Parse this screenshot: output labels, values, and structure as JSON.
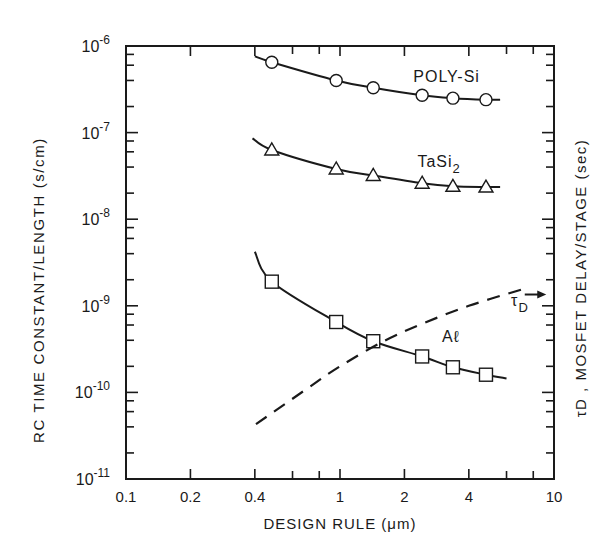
{
  "figure": {
    "xlabel": "DESIGN RULE (μm)",
    "ylabel_left": "RC TIME CONSTANT/LENGTH (s/cm)",
    "ylabel_right": "τD , MOSFET DELAY/STAGE (sec)"
  },
  "chart_data": {
    "type": "line",
    "title": "",
    "xlabel": "DESIGN RULE (μm)",
    "ylabel": "RC TIME CONSTANT/LENGTH (s/cm)",
    "ylabel_right": "τD , MOSFET DELAY/STAGE (sec)",
    "xscale": "log",
    "yscale": "log",
    "xlim": [
      0.1,
      10
    ],
    "ylim": [
      1e-11,
      1e-06
    ],
    "grid": false,
    "legend": "inline labels",
    "x_ticks": [
      {
        "value": 0.1,
        "label": "0.1"
      },
      {
        "value": 0.2,
        "label": "0.2"
      },
      {
        "value": 0.4,
        "label": "0.4"
      },
      {
        "value": 1,
        "label": "1"
      },
      {
        "value": 2,
        "label": "2"
      },
      {
        "value": 4,
        "label": "4"
      },
      {
        "value": 10,
        "label": "10"
      }
    ],
    "x_minor_ticks": [
      0.6,
      0.8,
      6,
      8
    ],
    "y_ticks": [
      {
        "value": 1e-06,
        "base": "10",
        "exp": "-6"
      },
      {
        "value": 1e-07,
        "base": "10",
        "exp": "-7"
      },
      {
        "value": 1e-08,
        "base": "10",
        "exp": "-8"
      },
      {
        "value": 1e-09,
        "base": "10",
        "exp": "-9"
      },
      {
        "value": 1e-10,
        "base": "10",
        "exp": "-10"
      },
      {
        "value": 1e-11,
        "base": "10",
        "exp": "-11"
      }
    ],
    "series": [
      {
        "name": "POLY-Si",
        "label": "POLY-Si",
        "marker": "circle",
        "line": "solid",
        "curve_x": [
          0.4,
          0.48,
          0.96,
          1.43,
          2.42,
          3.37,
          4.81,
          5.6
        ],
        "curve_y": [
          7.6e-07,
          6.5e-07,
          4e-07,
          3.3e-07,
          2.7e-07,
          2.5e-07,
          2.4e-07,
          2.4e-07
        ],
        "x": [
          0.48,
          0.96,
          1.43,
          2.42,
          3.37,
          4.81
        ],
        "values": [
          6.5e-07,
          4e-07,
          3.3e-07,
          2.7e-07,
          2.5e-07,
          2.4e-07
        ],
        "label_pos": {
          "x": 2.2,
          "y": 3.8e-07
        }
      },
      {
        "name": "TaSi2",
        "label": "TaSi",
        "label_sub": "2",
        "marker": "triangle",
        "line": "solid",
        "curve_x": [
          0.39,
          0.48,
          0.96,
          1.43,
          2.42,
          3.37,
          4.81,
          5.6
        ],
        "curve_y": [
          8.6e-08,
          6.3e-08,
          3.8e-08,
          3.2e-08,
          2.6e-08,
          2.4e-08,
          2.35e-08,
          2.35e-08
        ],
        "x": [
          0.48,
          0.96,
          1.43,
          2.42,
          3.37,
          4.81
        ],
        "values": [
          6.3e-08,
          3.8e-08,
          3.2e-08,
          2.6e-08,
          2.4e-08,
          2.35e-08
        ],
        "label_pos": {
          "x": 2.3,
          "y": 4e-08
        }
      },
      {
        "name": "Al",
        "label": "Aℓ",
        "marker": "square",
        "line": "solid",
        "curve_x": [
          0.4,
          0.48,
          0.96,
          1.43,
          2.42,
          3.37,
          4.81,
          6.0
        ],
        "curve_y": [
          4.2e-09,
          1.9e-09,
          6.5e-10,
          3.9e-10,
          2.6e-10,
          1.95e-10,
          1.6e-10,
          1.45e-10
        ],
        "x": [
          0.48,
          0.96,
          1.43,
          2.42,
          3.37,
          4.81
        ],
        "values": [
          1.9e-09,
          6.5e-10,
          3.9e-10,
          2.6e-10,
          1.95e-10,
          1.6e-10
        ],
        "label_pos": {
          "x": 3.0,
          "y": 3.8e-10
        }
      },
      {
        "name": "τD (MOSFET delay/stage)",
        "label": "τ",
        "label_sub": "D",
        "marker": "none",
        "line": "dashed",
        "axis": "right",
        "curve_x": [
          0.405,
          0.7,
          1.0,
          1.6,
          2.5,
          4.0,
          7.1
        ],
        "curve_y": [
          4.3e-11,
          1.1e-10,
          2e-10,
          3.9e-10,
          6.4e-10,
          1e-09,
          1.55e-09
        ],
        "x": [
          0.405,
          7.1
        ],
        "values": [
          4.3e-11,
          1.55e-09
        ],
        "label_pos": {
          "x": 6.3,
          "y": 1e-09
        },
        "arrow": {
          "from_x": 7.3,
          "to_x": 9.2,
          "y": 1.35e-09
        }
      }
    ]
  }
}
